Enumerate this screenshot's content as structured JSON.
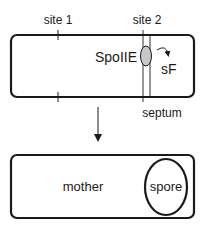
{
  "diagram": {
    "top_cell": {
      "labels": {
        "site1": "site 1",
        "site2": "site 2",
        "protein": "SpoIIE",
        "factor": "sF",
        "septum": "septum"
      }
    },
    "bottom_cell": {
      "labels": {
        "mother": "mother",
        "spore": "spore"
      }
    },
    "colors": {
      "stroke": "#1a1a1a",
      "protein_fill": "#c8c8c8",
      "background": "#ffffff"
    }
  }
}
